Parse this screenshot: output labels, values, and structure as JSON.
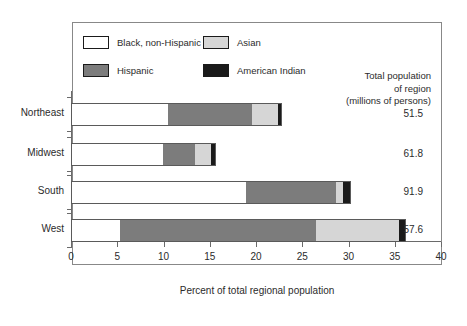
{
  "chart_data": {
    "type": "bar",
    "orientation": "horizontal",
    "stacked": true,
    "title": "",
    "xlabel": "Percent of total regional population",
    "ylabel": "",
    "xlim": [
      0,
      40
    ],
    "xticks": [
      0,
      5,
      10,
      15,
      20,
      25,
      30,
      35,
      40
    ],
    "grid": false,
    "legend_position": "top-left",
    "categories": [
      "Northeast",
      "Midwest",
      "South",
      "West"
    ],
    "series": [
      {
        "name": "Black, non-Hispanic",
        "color": "#ffffff",
        "values": [
          10.4,
          9.8,
          18.8,
          5.2
        ]
      },
      {
        "name": "Hispanic",
        "color": "#7c7c7c",
        "values": [
          9.1,
          3.5,
          9.7,
          21.2
        ]
      },
      {
        "name": "Asian",
        "color": "#d6d6d6",
        "values": [
          2.8,
          1.7,
          0.8,
          8.9
        ]
      },
      {
        "name": "American Indian",
        "color": "#1a1a1a",
        "values": [
          0.3,
          0.5,
          0.8,
          0.7
        ]
      }
    ],
    "totals": [
      22.6,
      15.5,
      30.1,
      36.0
    ],
    "annotation_column": {
      "header_lines": [
        "Total population",
        "of region",
        "(millions of persons)"
      ],
      "values": [
        "51.5",
        "61.8",
        "91.9",
        "57.6"
      ]
    }
  },
  "legend": {
    "items": [
      {
        "label": "Black, non-Hispanic",
        "swatch": "sw-white"
      },
      {
        "label": "Asian",
        "swatch": "sw-asian"
      },
      {
        "label": "Hispanic",
        "swatch": "sw-hisp"
      },
      {
        "label": "American Indian",
        "swatch": "sw-amind"
      }
    ]
  }
}
